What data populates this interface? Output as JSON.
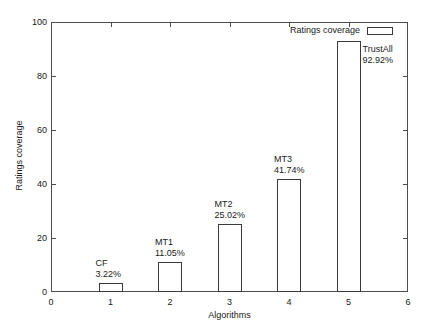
{
  "chart_data": {
    "type": "bar",
    "title": "",
    "xlabel": "Algorithms",
    "ylabel": "Ratings coverage",
    "xlim": [
      0,
      6
    ],
    "ylim": [
      0,
      100
    ],
    "xticks": [
      "0",
      "1",
      "2",
      "3",
      "4",
      "5",
      "6"
    ],
    "yticks": [
      "0",
      "20",
      "40",
      "60",
      "80",
      "100"
    ],
    "grid": false,
    "legend": {
      "position": "top-right-inside",
      "entries": [
        {
          "label": "Ratings coverage",
          "swatch": "open-rectangle"
        }
      ]
    },
    "categories": [
      "CF",
      "MT1",
      "MT2",
      "MT3",
      "TrustAll"
    ],
    "x": [
      1,
      2,
      3,
      4,
      5
    ],
    "values": [
      3.22,
      11.05,
      25.02,
      41.74,
      92.92
    ],
    "bars": [
      {
        "x": 1,
        "name": "CF",
        "value": 3.22,
        "value_label": "3.22%"
      },
      {
        "x": 2,
        "name": "MT1",
        "value": 11.05,
        "value_label": "11.05%"
      },
      {
        "x": 3,
        "name": "MT2",
        "value": 25.02,
        "value_label": "25.02%"
      },
      {
        "x": 4,
        "name": "MT3",
        "value": 41.74,
        "value_label": "41.74%"
      },
      {
        "x": 5,
        "name": "TrustAll",
        "value": 92.92,
        "value_label": "92.92%"
      }
    ],
    "colors": {
      "bar_stroke": "#3a3a3a",
      "bar_fill": "#ffffff",
      "axis": "#4d4d4d",
      "text": "#1a1a1a",
      "background": "#ffffff"
    }
  }
}
